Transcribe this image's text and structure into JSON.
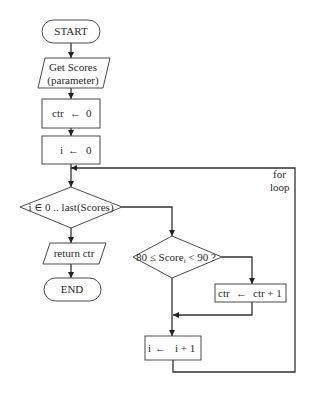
{
  "flowchart": {
    "start": "START",
    "input": {
      "line1": "Get Scores",
      "line2": "(parameter)"
    },
    "init_ctr": {
      "lhs": "ctr",
      "rhs": "0"
    },
    "init_i": {
      "lhs": "i",
      "rhs": "0"
    },
    "loop_condition": "i ∈ 0 .. last(Scores)",
    "output": "return ctr",
    "end": "END",
    "check": {
      "prefix": "80 ≤ Score",
      "subscript": "i",
      "suffix": " < 90 ?"
    },
    "increment_ctr": {
      "lhs": "ctr",
      "rhs": "ctr + 1"
    },
    "increment_i": {
      "lhs": "i",
      "rhs": "i + 1"
    },
    "loop_label": {
      "line1": "for",
      "line2": "loop"
    },
    "assign_arrow": "←"
  },
  "colors": {
    "stroke": "#4a4a4a",
    "line": "#333333",
    "text": "#2a2a2a",
    "background": "#ffffff"
  }
}
